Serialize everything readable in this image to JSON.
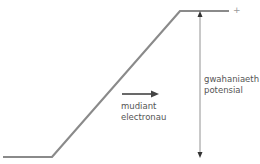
{
  "diagram": {
    "type": "potential-step",
    "colors": {
      "curve": "#8a8a8a",
      "arrow": "#444444",
      "dimension": "#777777",
      "text": "#555555",
      "plus": "#9a9a9a"
    },
    "curve_points": [
      [
        3,
        157
      ],
      [
        52,
        157
      ],
      [
        180,
        11
      ],
      [
        229,
        11
      ]
    ],
    "plus_label": "+",
    "flow_arrow": {
      "line1": "mudiant",
      "line2": "electronau"
    },
    "dimension": {
      "line1": "gwahaniaeth",
      "line2": "potensial"
    }
  }
}
